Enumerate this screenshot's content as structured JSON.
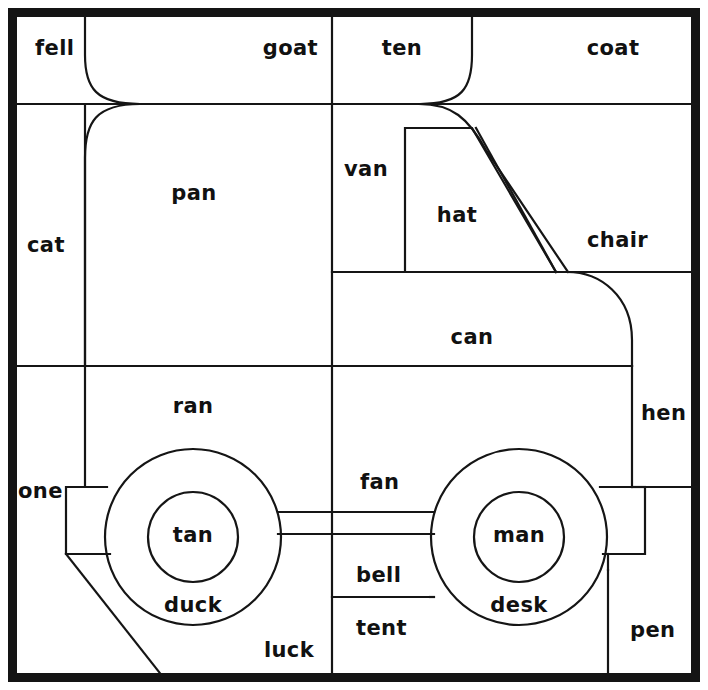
{
  "figure": {
    "kind": "coloring-page-word-puzzle",
    "canvas": {
      "width": 708,
      "height": 690
    },
    "colors": {
      "ink": "#151515",
      "paper": "#ffffff",
      "frame": "#141414"
    },
    "border": {
      "name": "outer-frame",
      "x": 8,
      "y": 8,
      "width": 692,
      "height": 674,
      "stroke_width": 9
    }
  },
  "words": [
    {
      "id": "fell",
      "text": "fell",
      "x": 35,
      "y": 55,
      "anchor": "start"
    },
    {
      "id": "goat",
      "text": "goat",
      "x": 318,
      "y": 55,
      "anchor": "end"
    },
    {
      "id": "ten",
      "text": "ten",
      "x": 402,
      "y": 55,
      "anchor": "middle"
    },
    {
      "id": "coat",
      "text": "coat",
      "x": 613,
      "y": 55,
      "anchor": "middle"
    },
    {
      "id": "pan",
      "text": "pan",
      "x": 194,
      "y": 200,
      "anchor": "middle"
    },
    {
      "id": "van",
      "text": "van",
      "x": 344,
      "y": 176,
      "anchor": "start"
    },
    {
      "id": "hat",
      "text": "hat",
      "x": 457,
      "y": 222,
      "anchor": "middle"
    },
    {
      "id": "chair",
      "text": "chair",
      "x": 587,
      "y": 247,
      "anchor": "start"
    },
    {
      "id": "cat",
      "text": "cat",
      "x": 27,
      "y": 252,
      "anchor": "start"
    },
    {
      "id": "can",
      "text": "can",
      "x": 472,
      "y": 344,
      "anchor": "middle"
    },
    {
      "id": "ran",
      "text": "ran",
      "x": 193,
      "y": 413,
      "anchor": "middle"
    },
    {
      "id": "hen",
      "text": "hen",
      "x": 641,
      "y": 420,
      "anchor": "start"
    },
    {
      "id": "one",
      "text": "one",
      "x": 18,
      "y": 498,
      "anchor": "start"
    },
    {
      "id": "fan",
      "text": "fan",
      "x": 360,
      "y": 489,
      "anchor": "start"
    },
    {
      "id": "tan",
      "text": "tan",
      "x": 193,
      "y": 542,
      "anchor": "middle"
    },
    {
      "id": "man",
      "text": "man",
      "x": 519,
      "y": 542,
      "anchor": "middle"
    },
    {
      "id": "bell",
      "text": "bell",
      "x": 356,
      "y": 582,
      "anchor": "start"
    },
    {
      "id": "duck",
      "text": "duck",
      "x": 193,
      "y": 612,
      "anchor": "middle"
    },
    {
      "id": "desk",
      "text": "desk",
      "x": 519,
      "y": 612,
      "anchor": "middle"
    },
    {
      "id": "tent",
      "text": "tent",
      "x": 356,
      "y": 635,
      "anchor": "start"
    },
    {
      "id": "luck",
      "text": "luck",
      "x": 289,
      "y": 657,
      "anchor": "middle"
    },
    {
      "id": "pen",
      "text": "pen",
      "x": 630,
      "y": 637,
      "anchor": "start"
    }
  ],
  "grid_lines": {
    "horizontal": [
      {
        "id": "h-top-row",
        "x1": 13,
        "x2": 697,
        "y": 104
      },
      {
        "id": "h-cab-floor",
        "x1": 332,
        "x2": 697,
        "y": 272
      },
      {
        "id": "h-body-bottom",
        "x1": 13,
        "x2": 632,
        "y": 366
      },
      {
        "id": "h-bell-tent",
        "x1": 332,
        "x2": 430,
        "y": 597
      }
    ],
    "vertical": [
      {
        "id": "v-center",
        "y1": 13,
        "y2": 677,
        "x": 332
      },
      {
        "id": "v-left",
        "y1": 104,
        "y2": 487,
        "x": 85
      },
      {
        "id": "v-hen-left",
        "y1": 366,
        "y2": 487,
        "x": 632
      },
      {
        "id": "v-pen-left",
        "y1": 570,
        "y2": 677,
        "x": 608
      },
      {
        "id": "v-cab-left",
        "y1": 272,
        "y2": 366,
        "x": 332
      }
    ]
  },
  "truck_shapes": [
    {
      "id": "hood-nose-curve",
      "name": "truck-hood-front-curve"
    },
    {
      "id": "cab-roof-curve",
      "name": "truck-cab-roof-curve"
    },
    {
      "id": "windshield",
      "name": "truck-windshield-pillar"
    },
    {
      "id": "cab-window",
      "name": "truck-cab-window"
    },
    {
      "id": "rear-body-curve",
      "name": "truck-rear-body-curve"
    },
    {
      "id": "wheel-front",
      "name": "truck-front-wheel",
      "cx": 193,
      "cy": 537,
      "r_outer": 88,
      "r_inner": 45
    },
    {
      "id": "wheel-rear",
      "name": "truck-rear-wheel",
      "cx": 519,
      "cy": 537,
      "r_outer": 88,
      "r_inner": 45
    },
    {
      "id": "axle",
      "name": "truck-axle-bar"
    },
    {
      "id": "front-bumper",
      "name": "truck-front-bumper"
    },
    {
      "id": "rear-bumper",
      "name": "truck-rear-bumper"
    },
    {
      "id": "front-skirt",
      "name": "truck-front-skirt"
    }
  ]
}
